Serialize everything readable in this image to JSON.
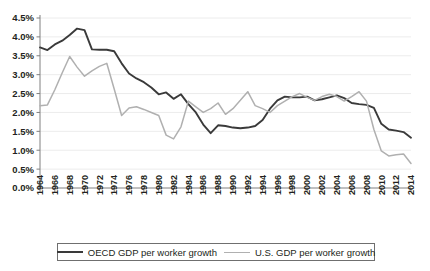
{
  "chart_data": {
    "type": "line",
    "title": "",
    "xlabel": "",
    "ylabel": "",
    "ylim": [
      0,
      4.5
    ],
    "ytick_labels": [
      "0.0%",
      "0.5%",
      "1.0%",
      "1.5%",
      "2.0%",
      "2.5%",
      "3.0%",
      "3.5%",
      "4.0%",
      "4.5%"
    ],
    "ytick_values": [
      0,
      0.5,
      1.0,
      1.5,
      2.0,
      2.5,
      3.0,
      3.5,
      4.0,
      4.5
    ],
    "grid": true,
    "legend_position": "bottom",
    "x": [
      1964,
      1965,
      1966,
      1967,
      1968,
      1969,
      1970,
      1971,
      1972,
      1973,
      1974,
      1975,
      1976,
      1977,
      1978,
      1979,
      1980,
      1981,
      1982,
      1983,
      1984,
      1985,
      1986,
      1987,
      1988,
      1989,
      1990,
      1991,
      1992,
      1993,
      1994,
      1995,
      1996,
      1997,
      1998,
      1999,
      2000,
      2001,
      2002,
      2003,
      2004,
      2005,
      2006,
      2007,
      2008,
      2009,
      2010,
      2011,
      2012,
      2013,
      2014
    ],
    "xtick_labels": [
      "1964",
      "1966",
      "1968",
      "1970",
      "1972",
      "1974",
      "1976",
      "1978",
      "1980",
      "1982",
      "1984",
      "1986",
      "1988",
      "1990",
      "1992",
      "1994",
      "1996",
      "1998",
      "2000",
      "2002",
      "2004",
      "2006",
      "2008",
      "2010",
      "2012",
      "2014"
    ],
    "series": [
      {
        "name": "OECD GDP per worker growth",
        "color": "#3a3a3a",
        "width": 1.9,
        "values": [
          3.72,
          3.65,
          3.8,
          3.9,
          4.05,
          4.22,
          4.18,
          3.67,
          3.66,
          3.66,
          3.62,
          3.3,
          3.03,
          2.9,
          2.8,
          2.66,
          2.48,
          2.53,
          2.36,
          2.48,
          2.22,
          2.0,
          1.68,
          1.45,
          1.66,
          1.64,
          1.6,
          1.58,
          1.6,
          1.64,
          1.8,
          2.1,
          2.32,
          2.42,
          2.4,
          2.4,
          2.42,
          2.32,
          2.35,
          2.4,
          2.45,
          2.38,
          2.25,
          2.22,
          2.2,
          2.12,
          1.7,
          1.55,
          1.52,
          1.48,
          1.33
        ]
      },
      {
        "name": "U.S. GDP per worker growth",
        "color": "#b0b0b0",
        "width": 1.5,
        "values": [
          2.18,
          2.2,
          2.6,
          3.05,
          3.48,
          3.2,
          2.96,
          3.1,
          3.22,
          3.3,
          2.62,
          1.92,
          2.12,
          2.15,
          2.08,
          2.0,
          1.92,
          1.4,
          1.3,
          1.62,
          2.3,
          2.15,
          2.0,
          2.1,
          2.25,
          1.95,
          2.1,
          2.32,
          2.55,
          2.18,
          2.1,
          2.0,
          2.18,
          2.3,
          2.42,
          2.5,
          2.4,
          2.32,
          2.42,
          2.48,
          2.42,
          2.3,
          2.42,
          2.55,
          2.3,
          1.55,
          0.98,
          0.85,
          0.88,
          0.9,
          0.65
        ]
      }
    ]
  },
  "legend": {
    "entries": [
      {
        "label": "OECD GDP per worker growth"
      },
      {
        "label": "U.S. GDP per worker growth"
      }
    ]
  }
}
